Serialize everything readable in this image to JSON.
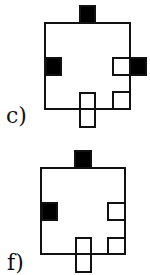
{
  "figures": [
    {
      "label": "c)",
      "colors": {
        "filled": "#000000",
        "outline": "#111111"
      },
      "squares": [
        {
          "position": "top-center",
          "fill": "black"
        },
        {
          "position": "left-middle",
          "fill": "black"
        },
        {
          "position": "right-middle-outside",
          "fill": "black"
        },
        {
          "position": "right-middle-inside",
          "fill": "white"
        },
        {
          "position": "bottom-right-inside",
          "fill": "white"
        },
        {
          "position": "bottom-center-straddling",
          "fill": "white"
        }
      ]
    },
    {
      "label": "f)",
      "colors": {
        "filled": "#000000",
        "outline": "#111111"
      },
      "squares": [
        {
          "position": "top-center",
          "fill": "black"
        },
        {
          "position": "left-middle",
          "fill": "black"
        },
        {
          "position": "right-middle-inside",
          "fill": "white"
        },
        {
          "position": "bottom-right-inside",
          "fill": "white"
        },
        {
          "position": "bottom-center-straddling",
          "fill": "white"
        }
      ]
    }
  ]
}
